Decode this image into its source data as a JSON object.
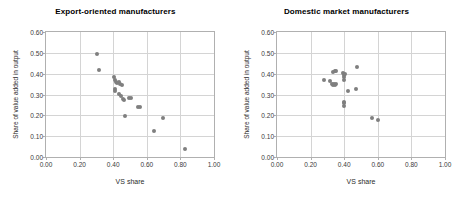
{
  "figure": {
    "panels": [
      "export",
      "domestic"
    ]
  },
  "chart_data": [
    {
      "type": "scatter",
      "title": "Export-oriented manufacturers",
      "xlabel": "VS share",
      "ylabel": "Share of value added in output",
      "xlim": [
        0.0,
        1.0
      ],
      "ylim": [
        0.0,
        0.6
      ],
      "xticks": [
        "0.00",
        "0.20",
        "0.40",
        "0.60",
        "0.80",
        "1.00"
      ],
      "xtick_values": [
        0.0,
        0.2,
        0.4,
        0.6,
        0.8,
        1.0
      ],
      "yticks": [
        "0.00",
        "0.10",
        "0.20",
        "0.30",
        "0.40",
        "0.50",
        "0.60"
      ],
      "ytick_values": [
        0.0,
        0.1,
        0.2,
        0.3,
        0.4,
        0.5,
        0.6
      ],
      "grid": true,
      "legend": "none",
      "marker_color": "#7f7f7f",
      "points": [
        {
          "x": 0.305,
          "y": 0.494
        },
        {
          "x": 0.313,
          "y": 0.416
        },
        {
          "x": 0.405,
          "y": 0.383
        },
        {
          "x": 0.412,
          "y": 0.37
        },
        {
          "x": 0.418,
          "y": 0.36
        },
        {
          "x": 0.424,
          "y": 0.355
        },
        {
          "x": 0.432,
          "y": 0.358
        },
        {
          "x": 0.44,
          "y": 0.352
        },
        {
          "x": 0.452,
          "y": 0.348
        },
        {
          "x": 0.408,
          "y": 0.325
        },
        {
          "x": 0.412,
          "y": 0.316
        },
        {
          "x": 0.432,
          "y": 0.302
        },
        {
          "x": 0.446,
          "y": 0.292
        },
        {
          "x": 0.458,
          "y": 0.278
        },
        {
          "x": 0.466,
          "y": 0.274
        },
        {
          "x": 0.492,
          "y": 0.283
        },
        {
          "x": 0.504,
          "y": 0.283
        },
        {
          "x": 0.468,
          "y": 0.197
        },
        {
          "x": 0.548,
          "y": 0.241
        },
        {
          "x": 0.562,
          "y": 0.241
        },
        {
          "x": 0.645,
          "y": 0.127
        },
        {
          "x": 0.698,
          "y": 0.186
        },
        {
          "x": 0.828,
          "y": 0.04
        }
      ]
    },
    {
      "type": "scatter",
      "title": "Domestic market manufacturers",
      "xlabel": "VS share",
      "ylabel": "Share of value added in output",
      "xlim": [
        0.0,
        1.0
      ],
      "ylim": [
        0.0,
        0.6
      ],
      "xticks": [
        "0.00",
        "0.20",
        "0.40",
        "0.60",
        "0.80",
        "1.00"
      ],
      "xtick_values": [
        0.0,
        0.2,
        0.4,
        0.6,
        0.8,
        1.0
      ],
      "yticks": [
        "0.00",
        "0.10",
        "0.20",
        "0.30",
        "0.40",
        "0.50",
        "0.60"
      ],
      "ytick_values": [
        0.0,
        0.1,
        0.2,
        0.3,
        0.4,
        0.5,
        0.6
      ],
      "grid": true,
      "legend": "none",
      "marker_color": "#7f7f7f",
      "points": [
        {
          "x": 0.282,
          "y": 0.368
        },
        {
          "x": 0.318,
          "y": 0.367
        },
        {
          "x": 0.325,
          "y": 0.352
        },
        {
          "x": 0.332,
          "y": 0.345
        },
        {
          "x": 0.34,
          "y": 0.35
        },
        {
          "x": 0.348,
          "y": 0.348
        },
        {
          "x": 0.352,
          "y": 0.352
        },
        {
          "x": 0.336,
          "y": 0.408
        },
        {
          "x": 0.345,
          "y": 0.414
        },
        {
          "x": 0.352,
          "y": 0.412
        },
        {
          "x": 0.392,
          "y": 0.402
        },
        {
          "x": 0.398,
          "y": 0.393
        },
        {
          "x": 0.4,
          "y": 0.385
        },
        {
          "x": 0.404,
          "y": 0.398
        },
        {
          "x": 0.4,
          "y": 0.368
        },
        {
          "x": 0.478,
          "y": 0.434
        },
        {
          "x": 0.424,
          "y": 0.318
        },
        {
          "x": 0.47,
          "y": 0.325
        },
        {
          "x": 0.4,
          "y": 0.265
        },
        {
          "x": 0.4,
          "y": 0.258
        },
        {
          "x": 0.398,
          "y": 0.243
        },
        {
          "x": 0.568,
          "y": 0.185
        },
        {
          "x": 0.604,
          "y": 0.178
        }
      ]
    }
  ]
}
